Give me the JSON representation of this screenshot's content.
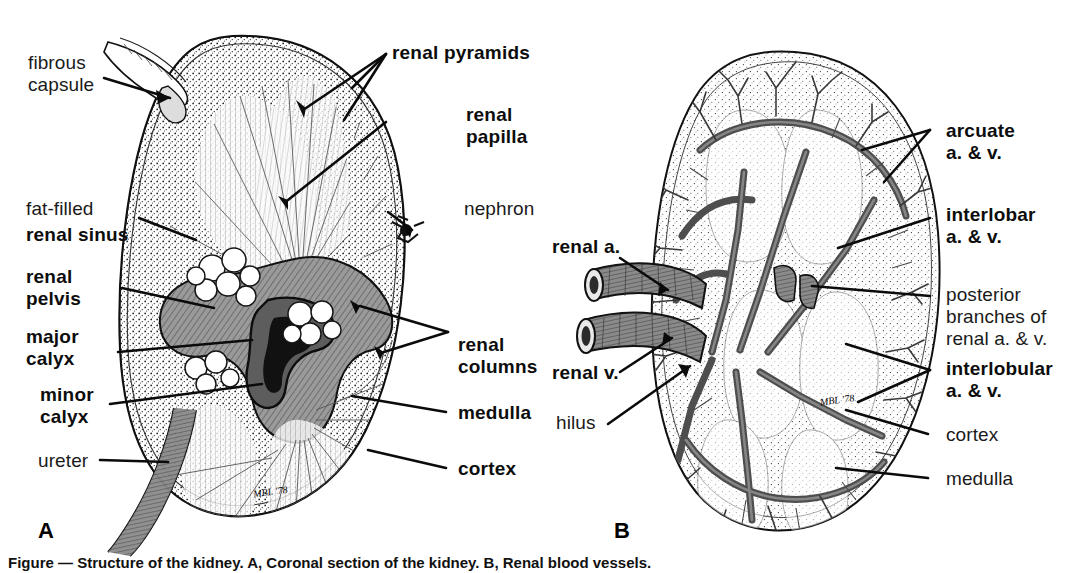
{
  "figure": {
    "background_color": "#ffffff",
    "ink_color": "#111111",
    "sinus_fill": "#8d8d8d",
    "vessel_fill": "#6f6f6f",
    "cortex_fill": "#f2f2f2"
  },
  "panels": [
    {
      "letter": "A",
      "name": "coronal-section"
    },
    {
      "letter": "B",
      "name": "renal-vasculature"
    }
  ],
  "panel_a": {
    "letter": "A",
    "signature": "MBL '78",
    "labels": [
      {
        "id": "fibrous-capsule",
        "text": "fibrous\ncapsule",
        "weight": "light",
        "align": "left"
      },
      {
        "id": "fat-filled",
        "text": "fat-filled",
        "weight": "light",
        "align": "left"
      },
      {
        "id": "renal-sinus",
        "text": "renal sinus",
        "weight": "bold",
        "align": "left"
      },
      {
        "id": "renal-pelvis",
        "text": "renal\npelvis",
        "weight": "bold",
        "align": "left"
      },
      {
        "id": "major-calyx",
        "text": "major\ncalyx",
        "weight": "bold",
        "align": "left"
      },
      {
        "id": "minor-calyx",
        "text": "minor\ncalyx",
        "weight": "bold",
        "align": "left"
      },
      {
        "id": "ureter",
        "text": "ureter",
        "weight": "light",
        "align": "left"
      },
      {
        "id": "renal-pyramids",
        "text": "renal pyramids",
        "weight": "bold",
        "align": "left"
      },
      {
        "id": "renal-papilla",
        "text": "renal\npapilla",
        "weight": "bold",
        "align": "left"
      },
      {
        "id": "nephron",
        "text": "nephron",
        "weight": "light",
        "align": "left"
      },
      {
        "id": "renal-columns",
        "text": "renal\ncolumns",
        "weight": "bold",
        "align": "left"
      },
      {
        "id": "medulla",
        "text": "medulla",
        "weight": "bold",
        "align": "left"
      },
      {
        "id": "cortex",
        "text": "cortex",
        "weight": "bold",
        "align": "left"
      }
    ]
  },
  "panel_b": {
    "letter": "B",
    "signature": "MBL '78",
    "labels": [
      {
        "id": "renal-artery",
        "text": "renal a.",
        "weight": "bold",
        "align": "left"
      },
      {
        "id": "renal-vein",
        "text": "renal v.",
        "weight": "bold",
        "align": "left"
      },
      {
        "id": "hilus",
        "text": "hilus",
        "weight": "light",
        "align": "left"
      },
      {
        "id": "arcuate",
        "text": "arcuate\na. & v.",
        "weight": "bold",
        "align": "left"
      },
      {
        "id": "interlobar",
        "text": "interlobar\na. & v.",
        "weight": "bold",
        "align": "left"
      },
      {
        "id": "posterior-branches",
        "text": "posterior\nbranches of\nrenal a. & v.",
        "weight": "light",
        "align": "left"
      },
      {
        "id": "interlobular",
        "text": "interlobular\na. & v.",
        "weight": "bold",
        "align": "left"
      },
      {
        "id": "cortex-b",
        "text": "cortex",
        "weight": "light",
        "align": "left"
      },
      {
        "id": "medulla-b",
        "text": "medulla",
        "weight": "light",
        "align": "left"
      }
    ]
  },
  "caption": {
    "text": "Figure — Structure of the kidney. A, Coronal section of the kidney. B, Renal blood vessels."
  }
}
